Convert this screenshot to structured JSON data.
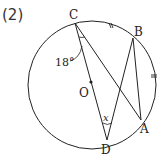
{
  "problem_label": "(2)",
  "points": {
    "C": "C",
    "B": "B",
    "A": "A",
    "D": "D",
    "O": "O"
  },
  "angle_label": "18°",
  "unknown_label": "x",
  "colors": {
    "stroke": "#222222",
    "background": "#ffffff"
  }
}
